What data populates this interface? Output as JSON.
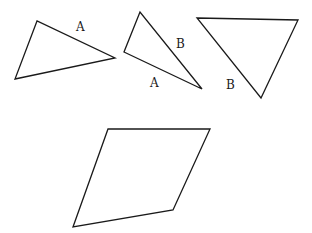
{
  "diagram": {
    "stroke_color": "#1a1a1a",
    "background": "#ffffff",
    "shapes": [
      {
        "id": "triangle-1",
        "type": "triangle",
        "points": "37,21 15,79 115,58",
        "labels": [
          {
            "text": "A",
            "x": 76,
            "y": 31
          }
        ]
      },
      {
        "id": "triangle-2",
        "type": "triangle",
        "points": "140,12 124,52 202,89",
        "labels": [
          {
            "text": "B",
            "x": 176,
            "y": 48
          },
          {
            "text": "A",
            "x": 150,
            "y": 87
          }
        ]
      },
      {
        "id": "triangle-3",
        "type": "triangle",
        "points": "197,18 298,20 261,98",
        "labels": [
          {
            "text": "B",
            "x": 226,
            "y": 89
          }
        ]
      },
      {
        "id": "parallelogram",
        "type": "parallelogram",
        "points": "108,129 210,129 173,210 73,227",
        "labels": []
      }
    ]
  }
}
